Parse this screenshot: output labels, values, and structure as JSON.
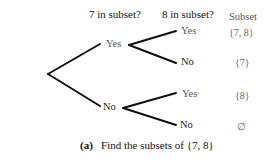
{
  "headers": {
    "col1": "7 in subset?",
    "col2": "8 in subset?",
    "col3": "Subset"
  },
  "tree": {
    "level1": [
      {
        "label": "Yes"
      },
      {
        "label": "No"
      }
    ],
    "level2": [
      {
        "label": "Yes",
        "subset": "{7, 8}"
      },
      {
        "label": "No",
        "subset": "{7}"
      },
      {
        "label": "Yes",
        "subset": "{8}"
      },
      {
        "label": "No",
        "subset": "∅"
      }
    ]
  },
  "caption": {
    "tag": "(a)",
    "text": "Find the subsets of {7, 8}"
  },
  "colors": {
    "lines": "#111111",
    "text_light": "#555555"
  }
}
